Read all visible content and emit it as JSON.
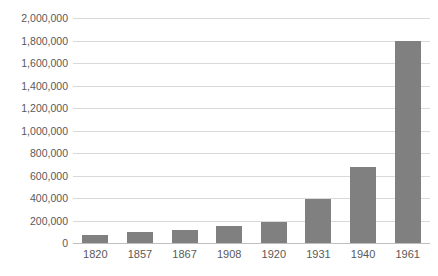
{
  "chart_data": {
    "type": "bar",
    "title": "",
    "subtitle": "",
    "xlabel": "",
    "ylabel": "",
    "categories": [
      "1820",
      "1857",
      "1867",
      "1908",
      "1920",
      "1931",
      "1940",
      "1961"
    ],
    "values": [
      70000,
      100000,
      120000,
      150000,
      190000,
      390000,
      680000,
      1800000
    ],
    "series": [
      {
        "name": "",
        "values": [
          70000,
          100000,
          120000,
          150000,
          190000,
          390000,
          680000,
          1800000
        ]
      }
    ],
    "ylim": [
      0,
      2000000
    ],
    "ytick_step": 200000,
    "ytick_labels": [
      "0",
      "200,000",
      "400,000",
      "600,000",
      "800,000",
      "1,000,000",
      "1,200,000",
      "1,400,000",
      "1,600,000",
      "1,800,000",
      "2,000,000"
    ],
    "ytick_values": [
      0,
      200000,
      400000,
      600000,
      800000,
      1000000,
      1200000,
      1400000,
      1600000,
      1800000,
      2000000
    ],
    "grid": {
      "horizontal": true,
      "vertical": false,
      "color": "#d9d9d9"
    },
    "legend": {
      "visible": false,
      "position": "none",
      "entries": []
    },
    "colors": {
      "bar": "#808080",
      "gridline": "#d9d9d9",
      "axis_line": "#bfbfbf",
      "tick_label": "#595959",
      "background": "#ffffff"
    }
  }
}
